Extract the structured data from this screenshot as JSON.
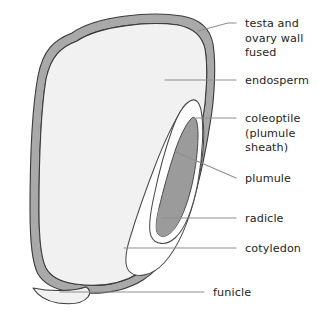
{
  "diagram": {
    "type": "labelled-biological-diagram",
    "background_color": "#ffffff",
    "structures": [
      {
        "key": "testa_ovary_wall",
        "name": "testa and ovary wall fused",
        "fill_color": "#a8a8a8",
        "stroke_color": "#3a3a3a",
        "description": "outer gray band enclosing the whole grain"
      },
      {
        "key": "endosperm",
        "name": "endosperm",
        "fill_color": "#f1f1f1",
        "stroke_color": "#3a3a3a",
        "description": "large pale interior region filling most of the grain"
      },
      {
        "key": "cotyledon",
        "name": "cotyledon",
        "fill_color": "#ffffff",
        "stroke_color": "#4a4a4a",
        "description": "white scutellum-like body on the right flank"
      },
      {
        "key": "coleoptile",
        "name": "coleoptile (plumule sheath)",
        "fill_color": "#ffffff",
        "stroke_color": "#4a4a4a",
        "description": "white sheath wrapping the plumule at the upper right"
      },
      {
        "key": "plumule",
        "name": "plumule",
        "fill_color": "#9b9b9b",
        "stroke_color": "#4a4a4a",
        "description": "dark gray elongated body inside the coleoptile"
      },
      {
        "key": "radicle",
        "name": "radicle",
        "fill_color": "#9b9b9b",
        "stroke_color": "#4a4a4a",
        "description": "lower end of the dark gray embryonic axis"
      },
      {
        "key": "funicle",
        "name": "funicle",
        "fill_color": "#f1f1f1",
        "stroke_color": "#3a3a3a",
        "description": "short stalk at the base of the grain"
      }
    ],
    "labels": [
      {
        "key": "testa_ovary_wall",
        "lines": [
          "testa and",
          "ovary wall",
          "fused"
        ],
        "text_x": 245,
        "text_y": 27,
        "line_height": 14.5,
        "leader": "M 236 23 L 228 23 L 198 31",
        "anchor": "start"
      },
      {
        "key": "endosperm",
        "lines": [
          "endosperm"
        ],
        "text_x": 245,
        "text_y": 84,
        "line_height": 14.5,
        "leader": "M 236 80 L 165 80",
        "anchor": "start"
      },
      {
        "key": "coleoptile",
        "lines": [
          "coleoptile",
          "(plumule",
          "sheath)"
        ],
        "text_x": 245,
        "text_y": 122,
        "line_height": 14.5,
        "leader": "M 236 118 L 196 118",
        "anchor": "start"
      },
      {
        "key": "plumule",
        "lines": [
          "plumule"
        ],
        "text_x": 245,
        "text_y": 182,
        "line_height": 14.5,
        "leader": "M 236 178 L 176 152",
        "anchor": "start"
      },
      {
        "key": "radicle",
        "lines": [
          "radicle"
        ],
        "text_x": 245,
        "text_y": 222,
        "line_height": 14.5,
        "leader": "M 236 218 L 162 218",
        "anchor": "start"
      },
      {
        "key": "cotyledon",
        "lines": [
          "cotyledon"
        ],
        "text_x": 245,
        "text_y": 252,
        "line_height": 14.5,
        "leader": "M 236 248 L 124 248",
        "anchor": "start"
      },
      {
        "key": "funicle",
        "lines": [
          "funicle"
        ],
        "text_x": 213,
        "text_y": 296,
        "line_height": 14.5,
        "leader": "M 204 292 L 60 292",
        "anchor": "start"
      }
    ]
  }
}
